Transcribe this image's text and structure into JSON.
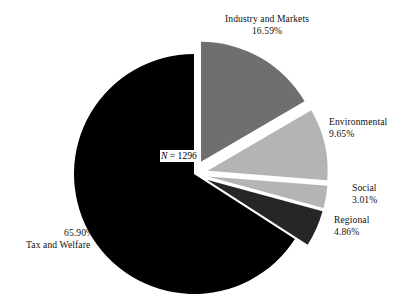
{
  "chart_data": {
    "type": "pie",
    "title": "",
    "subtitle": "",
    "xlabel": "",
    "ylabel": "",
    "legend_position": "none",
    "grid": false,
    "total_label": "N = 1296",
    "total_n": 1296,
    "start_angle_deg": 0,
    "direction": "clockwise",
    "categories": [
      "Industry and Markets",
      "Environmental",
      "Social",
      "Regional",
      "Tax and Welfare"
    ],
    "values": [
      16.59,
      9.65,
      3.01,
      4.86,
      65.9
    ],
    "value_labels": [
      "16.59%",
      "9.65%",
      "3.01%",
      "4.86%",
      "65.90%"
    ],
    "units": "percent",
    "slices": [
      {
        "name": "Industry and Markets",
        "value": 16.59,
        "value_label": "16.59%",
        "color": "#6f6f6f",
        "exploded": true
      },
      {
        "name": "Environmental",
        "value": 9.65,
        "value_label": "9.65%",
        "color": "#b4b4b4",
        "exploded": true
      },
      {
        "name": "Social",
        "value": 3.01,
        "value_label": "3.01%",
        "color": "#b4b4b4",
        "exploded": true
      },
      {
        "name": "Regional",
        "value": 4.86,
        "value_label": "4.86%",
        "color": "#262626",
        "exploded": true
      },
      {
        "name": "Tax and Welfare",
        "value": 65.9,
        "value_label": "65.90%",
        "color": "#000000",
        "exploded": false
      }
    ]
  },
  "labels": {
    "industry": {
      "name": "Industry and Markets",
      "value": "16.59%"
    },
    "environmental": {
      "name": "Environmental",
      "value": "9.65%"
    },
    "social": {
      "name": "Social",
      "value": "3.01%"
    },
    "regional": {
      "name": "Regional",
      "value": "4.86%"
    },
    "tax": {
      "name": "Tax and Welfare",
      "value": "65.90%"
    }
  },
  "annotation": {
    "n_symbol": "N",
    "n_value": " = 1296"
  }
}
